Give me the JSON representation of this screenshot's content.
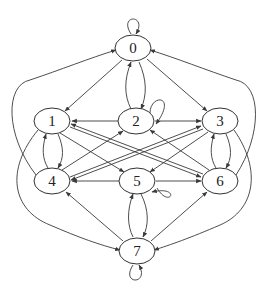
{
  "diagram": {
    "type": "directed-graph",
    "colors": {
      "stroke": "#3a3a3a",
      "node_fill": "#ffffff",
      "text": "#222222",
      "background": "#ffffff"
    },
    "nodes": [
      {
        "id": "0",
        "label": "0",
        "x": 133,
        "y": 48
      },
      {
        "id": "1",
        "label": "1",
        "x": 52,
        "y": 121
      },
      {
        "id": "2",
        "label": "2",
        "x": 136,
        "y": 121
      },
      {
        "id": "3",
        "label": "3",
        "x": 220,
        "y": 121
      },
      {
        "id": "4",
        "label": "4",
        "x": 52,
        "y": 181
      },
      {
        "id": "5",
        "label": "5",
        "x": 137,
        "y": 181
      },
      {
        "id": "6",
        "label": "6",
        "x": 220,
        "y": 181
      },
      {
        "id": "7",
        "label": "7",
        "x": 137,
        "y": 251
      }
    ],
    "edges": [
      {
        "from": "0",
        "to": "0",
        "self_loop": true
      },
      {
        "from": "0",
        "to": "1"
      },
      {
        "from": "0",
        "to": "3"
      },
      {
        "from": "0",
        "to": "2"
      },
      {
        "from": "2",
        "to": "0"
      },
      {
        "from": "2",
        "to": "2",
        "self_loop": true
      },
      {
        "from": "2",
        "to": "1"
      },
      {
        "from": "2",
        "to": "3"
      },
      {
        "from": "1",
        "to": "4"
      },
      {
        "from": "4",
        "to": "1"
      },
      {
        "from": "3",
        "to": "6"
      },
      {
        "from": "6",
        "to": "3"
      },
      {
        "from": "1",
        "to": "5"
      },
      {
        "from": "1",
        "to": "6"
      },
      {
        "from": "6",
        "to": "1"
      },
      {
        "from": "4",
        "to": "2"
      },
      {
        "from": "4",
        "to": "3"
      },
      {
        "from": "3",
        "to": "4"
      },
      {
        "from": "3",
        "to": "5"
      },
      {
        "from": "6",
        "to": "2"
      },
      {
        "from": "5",
        "to": "4"
      },
      {
        "from": "5",
        "to": "6"
      },
      {
        "from": "5",
        "to": "5",
        "self_loop": true
      },
      {
        "from": "5",
        "to": "7"
      },
      {
        "from": "7",
        "to": "5"
      },
      {
        "from": "7",
        "to": "4"
      },
      {
        "from": "7",
        "to": "6"
      },
      {
        "from": "7",
        "to": "7",
        "self_loop": true
      },
      {
        "from": "4",
        "to": "0",
        "curved": "outer-left"
      },
      {
        "from": "6",
        "to": "0",
        "curved": "outer-right"
      },
      {
        "from": "1",
        "to": "7",
        "curved": "outer-left"
      },
      {
        "from": "3",
        "to": "7",
        "curved": "outer-right"
      }
    ]
  }
}
